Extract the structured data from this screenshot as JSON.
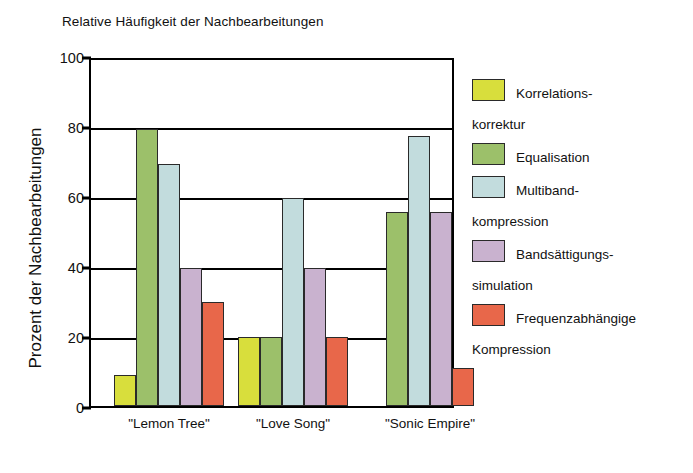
{
  "chart_data": {
    "type": "bar",
    "title": "Relative Häufigkeit der Nachbearbeitungen",
    "xlabel": "",
    "ylabel": "Prozent der Nachbearbeitungen",
    "ylim": [
      0,
      100
    ],
    "yticks": [
      0,
      20,
      40,
      60,
      80,
      100
    ],
    "grid": true,
    "legend_position": "right",
    "categories": [
      "\"Lemon Tree\"",
      "\"Love Song\"",
      "\"Sonic Empire\""
    ],
    "series": [
      {
        "name": "Korrelations-korrektur",
        "name_line1": "Korrelations-",
        "name_line2": "korrektur",
        "color": "#d8de3c",
        "values": [
          9,
          20,
          0
        ]
      },
      {
        "name": "Equalisation",
        "name_line1": "Equalisation",
        "name_line2": "",
        "color": "#9cc06a",
        "values": [
          80,
          20,
          56
        ]
      },
      {
        "name": "Multiband-kompression",
        "name_line1": "Multiband-",
        "name_line2": "kompression",
        "color": "#c2dcdd",
        "values": [
          70,
          60,
          78
        ]
      },
      {
        "name": "Bandsättigungs-simulation",
        "name_line1": "Bandsättigungs-",
        "name_line2": "simulation",
        "color": "#c9b2cf",
        "values": [
          40,
          40,
          56
        ]
      },
      {
        "name": "Frequenzabhängige Kompression",
        "name_line1": "Frequenzabhängige",
        "name_line2": "Kompression",
        "color": "#e8674a",
        "values": [
          30,
          20,
          11
        ]
      }
    ]
  },
  "axis": {
    "ytick_0": "0",
    "ytick_20": "20",
    "ytick_40": "40",
    "ytick_60": "60",
    "ytick_80": "80",
    "ytick_100": "100"
  }
}
